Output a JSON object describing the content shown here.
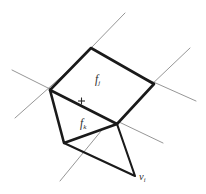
{
  "figure": {
    "width": 206,
    "height": 194,
    "background_color": "#ffffff",
    "edge_color": "#1a1a1a",
    "thin_line_color": "#8a8a8a",
    "label_color": "#2b2b2b"
  },
  "labels": {
    "face_upper": "f",
    "face_upper_sub": "j",
    "face_lower": "f",
    "face_lower_sub": "k",
    "vertex": "v",
    "vertex_sub": "i",
    "centroid_marker": "+"
  },
  "geometry": {
    "vertices": {
      "top": [
        91,
        48
      ],
      "left": [
        50,
        90
      ],
      "right": [
        154,
        84
      ],
      "center": [
        117,
        124
      ],
      "bottom_left": [
        64,
        143
      ],
      "bottom_spike": [
        135,
        176
      ]
    },
    "face_upper_polygon": "91,48 154,84 117,124 50,90",
    "face_lower_polygon": "50,90 117,124 64,143",
    "spike_polygon": "64,143 117,124 135,176",
    "thin_lines": [
      [
        125,
        13,
        58,
        82
      ],
      [
        12,
        70,
        92,
        110
      ],
      [
        15,
        118,
        78,
        62
      ],
      [
        190,
        48,
        128,
        107
      ],
      [
        196,
        101,
        131,
        72
      ],
      [
        60,
        181,
        120,
        108
      ],
      [
        163,
        143,
        96,
        111
      ]
    ],
    "centroid_marker_position": [
      81,
      101
    ],
    "centroid_marker_size": 6
  }
}
